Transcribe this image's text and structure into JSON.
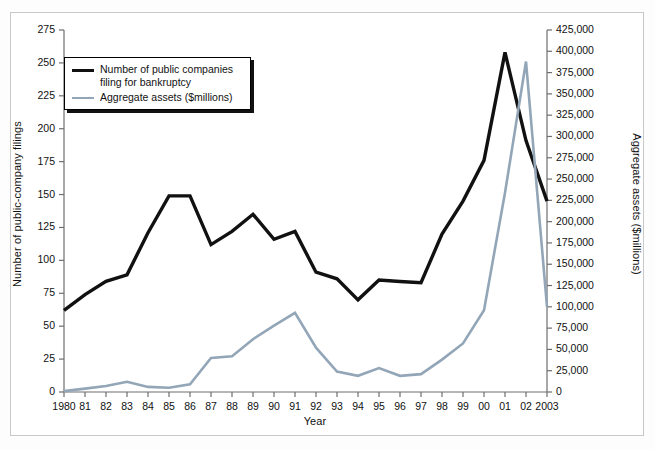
{
  "chart_data": {
    "type": "line",
    "title": "",
    "xlabel": "Year",
    "ylabel": "Number of public-company filings",
    "ylabel_right": "Aggregate assets ($millions)",
    "x": [
      1980,
      1981,
      1982,
      1983,
      1984,
      1985,
      1986,
      1987,
      1988,
      1989,
      1990,
      1991,
      1992,
      1993,
      1994,
      1995,
      1996,
      1997,
      1998,
      1999,
      2000,
      2001,
      2002,
      2003
    ],
    "categories": [
      "1980",
      "81",
      "82",
      "83",
      "84",
      "85",
      "86",
      "87",
      "88",
      "89",
      "90",
      "91",
      "92",
      "93",
      "94",
      "95",
      "96",
      "97",
      "98",
      "99",
      "00",
      "01",
      "02",
      "2003"
    ],
    "ylim": [
      0,
      275
    ],
    "ylim_right": [
      0,
      425000
    ],
    "yticks": [
      0,
      25,
      50,
      75,
      100,
      125,
      150,
      175,
      200,
      225,
      250,
      275
    ],
    "ytick_labels": [
      "0",
      "25",
      "50",
      "75",
      "100",
      "125",
      "150",
      "175",
      "200",
      "225",
      "250",
      "275"
    ],
    "yticks_right": [
      0,
      25000,
      50000,
      75000,
      100000,
      125000,
      150000,
      175000,
      200000,
      225000,
      250000,
      275000,
      300000,
      325000,
      350000,
      375000,
      400000,
      425000
    ],
    "ytick_labels_right": [
      "0",
      "25,000",
      "50,000",
      "75,000",
      "100,000",
      "125,000",
      "150,000",
      "175,000",
      "200,000",
      "225,000",
      "250,000",
      "275,000",
      "300,000",
      "325,000",
      "350,000",
      "375,000",
      "400,000",
      "425,000"
    ],
    "grid": false,
    "legend_position": "upper-left",
    "series": [
      {
        "name": "Number of public companies filing for bankruptcy",
        "axis": "left",
        "color": "#111111",
        "values": [
          62,
          74,
          84,
          89,
          121,
          149,
          149,
          112,
          122,
          135,
          116,
          122,
          91,
          86,
          70,
          85,
          84,
          83,
          120,
          145,
          176,
          258,
          191,
          145
        ]
      },
      {
        "name": "Aggregate assets ($millions)",
        "axis": "right",
        "color": "#93a6b8",
        "values": [
          1000,
          4000,
          7000,
          12000,
          6000,
          5000,
          9000,
          40000,
          42000,
          62000,
          78000,
          93000,
          52000,
          24000,
          19000,
          28000,
          19000,
          21000,
          38000,
          57000,
          96000,
          234000,
          388000,
          100000
        ]
      }
    ]
  },
  "legend": {
    "entries": [
      {
        "label_line1": "Number of public companies",
        "label_line2": "filing for bankruptcy",
        "swatch": "black"
      },
      {
        "label_line1": "Aggregate assets ($millions)",
        "label_line2": "",
        "swatch": "blue"
      }
    ]
  },
  "colors": {
    "series_black": "#111111",
    "series_blue": "#93a6b8",
    "frame_border": "#c9c9c9",
    "axis": "#6e6e6e",
    "text": "#111111",
    "background": "#ffffff"
  }
}
